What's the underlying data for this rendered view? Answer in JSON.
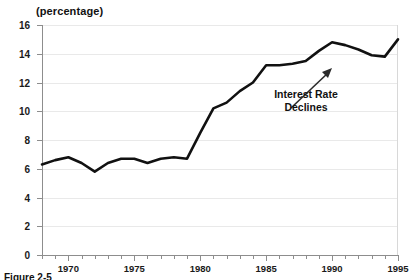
{
  "chart_data": {
    "type": "line",
    "title": "",
    "axis_note": "(percentage)",
    "xlabel": "",
    "ylabel": "",
    "xlim": [
      1968,
      1995
    ],
    "ylim": [
      0,
      16
    ],
    "yticks": [
      0,
      2,
      4,
      6,
      8,
      10,
      12,
      14,
      16
    ],
    "xticks_labeled": [
      1970,
      1975,
      1980,
      1985,
      1990,
      1995
    ],
    "grid": "horizontal",
    "legend": "none",
    "line_color": "#111111",
    "x": [
      1968,
      1969,
      1970,
      1971,
      1972,
      1973,
      1974,
      1975,
      1976,
      1977,
      1978,
      1979,
      1980,
      1981,
      1982,
      1983,
      1984,
      1985,
      1986,
      1987,
      1988,
      1989,
      1990,
      1991,
      1992,
      1993,
      1994,
      1995
    ],
    "values": [
      6.3,
      6.6,
      6.8,
      6.4,
      5.8,
      6.4,
      6.7,
      6.7,
      6.4,
      6.7,
      6.8,
      6.7,
      8.5,
      10.2,
      10.6,
      11.4,
      12.0,
      13.2,
      13.2,
      13.3,
      13.5,
      14.2,
      14.8,
      14.6,
      14.3,
      13.9,
      13.8,
      15.0
    ],
    "annotations": [
      {
        "text_line1": "Interest Rate",
        "text_line2": "Declines",
        "arrow": "up-right",
        "points_to_year": 1990
      }
    ]
  },
  "caption": {
    "text": "Figure 2-5"
  }
}
